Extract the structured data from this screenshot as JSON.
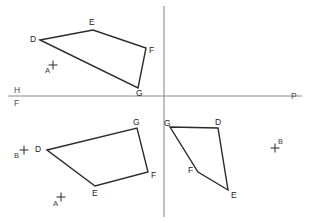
{
  "figure": {
    "canvas": {
      "width": 310,
      "height": 223
    },
    "colors": {
      "background": "#ffffff",
      "shape_stroke": "#2b2b2b",
      "reference_line": "#8a8a8a",
      "label_text": "#1c1c1c",
      "axis_label_text": "#4a4a4a"
    }
  },
  "reference_lines": {
    "horizontal": {
      "name": "ground-line",
      "x1": 8,
      "y1": 96,
      "x2": 302,
      "y2": 96,
      "label_above": "H",
      "label_below": "F",
      "label_right": "P",
      "label_above_pos": {
        "x": 14,
        "y": 93
      },
      "label_below_pos": {
        "x": 14,
        "y": 106
      },
      "label_right_pos": {
        "x": 291,
        "y": 95
      }
    },
    "vertical": {
      "name": "folding-line-vertical",
      "x1": 164,
      "y1": 6,
      "x2": 164,
      "y2": 217
    }
  },
  "shapes": [
    {
      "id": "top-view-quad",
      "name": "quadrilateral-top-view",
      "closed": true,
      "points": "40,40 93,30 146,48 138,88",
      "vertices": [
        {
          "label": "D",
          "x": 40,
          "y": 40,
          "lx": 30,
          "ly": 39
        },
        {
          "label": "E",
          "x": 93,
          "y": 30,
          "lx": 89,
          "ly": 24
        },
        {
          "label": "F",
          "x": 146,
          "y": 48,
          "lx": 149,
          "ly": 50
        },
        {
          "label": "G",
          "x": 138,
          "y": 88,
          "lx": 136,
          "ly": 96
        }
      ]
    },
    {
      "id": "front-view-quad",
      "name": "quadrilateral-front-view",
      "closed": true,
      "points": "47,150 137,128 148,172 95,186",
      "vertices": [
        {
          "label": "D",
          "x": 47,
          "y": 150,
          "lx": 37,
          "ly": 149
        },
        {
          "label": "G",
          "x": 137,
          "y": 128,
          "lx": 133,
          "ly": 124
        },
        {
          "label": "F",
          "x": 148,
          "y": 172,
          "lx": 151,
          "ly": 175
        },
        {
          "label": "E",
          "x": 95,
          "y": 186,
          "lx": 92,
          "ly": 195
        }
      ]
    },
    {
      "id": "profile-view-quad",
      "name": "quadrilateral-profile-view",
      "closed": true,
      "points": "170,127 218,128 228,190 198,172",
      "vertices": [
        {
          "label": "G",
          "x": 170,
          "y": 127,
          "lx": 165,
          "ly": 124
        },
        {
          "label": "D",
          "x": 218,
          "y": 128,
          "lx": 215,
          "ly": 123
        },
        {
          "label": "E",
          "x": 228,
          "y": 190,
          "lx": 231,
          "ly": 196
        },
        {
          "label": "F",
          "x": 198,
          "y": 172,
          "lx": 190,
          "ly": 171
        }
      ]
    }
  ],
  "points": [
    {
      "id": "point-a-top",
      "label": "A",
      "x": 53,
      "y": 65,
      "lx": 46,
      "ly": 72,
      "marker": "plus-cross"
    },
    {
      "id": "point-b-left",
      "label": "B",
      "x": 24,
      "y": 150,
      "lx": 15,
      "ly": 157,
      "marker": "plus-cross"
    },
    {
      "id": "point-a-bottom",
      "label": "A",
      "x": 61,
      "y": 197,
      "lx": 54,
      "ly": 205,
      "marker": "plus-cross"
    },
    {
      "id": "point-b-right",
      "label": "B",
      "x": 275,
      "y": 148,
      "lx": 279,
      "ly": 142,
      "marker": "plus-cross"
    }
  ],
  "marker": {
    "arm_length": 4.5
  }
}
